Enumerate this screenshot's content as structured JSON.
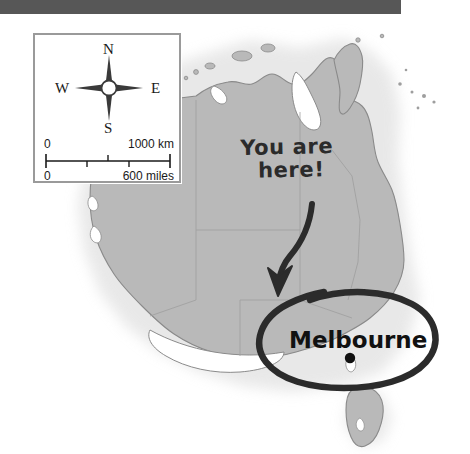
{
  "map": {
    "title": "Australia",
    "land_color": "#b9b9b9",
    "coastline_color": "#8a8a8a",
    "ocean_color": "#ffffff",
    "halo_color": "#e2e2e2"
  },
  "top_bar": {
    "name": "page-header-bar",
    "color": "#575757"
  },
  "legend": {
    "border_color": "#9a9a9a",
    "background": "#ffffff",
    "compass": {
      "north": "N",
      "south": "S",
      "west": "W",
      "east": "E",
      "color": "#1a1a1a"
    },
    "scale": {
      "km_min": "0",
      "km_max": "1000 km",
      "miles_min": "0",
      "miles_max": "600 miles",
      "km_ticks": 2,
      "mile_ticks": 3
    }
  },
  "annotations": {
    "marker_color": "#2b2b2b",
    "callout_line1": "You are",
    "callout_line2": "here!",
    "city_label": "Melbourne",
    "city_dot_color": "#111111",
    "arrow": "curved-down-arrow",
    "circle": "hand-drawn-ellipse"
  }
}
